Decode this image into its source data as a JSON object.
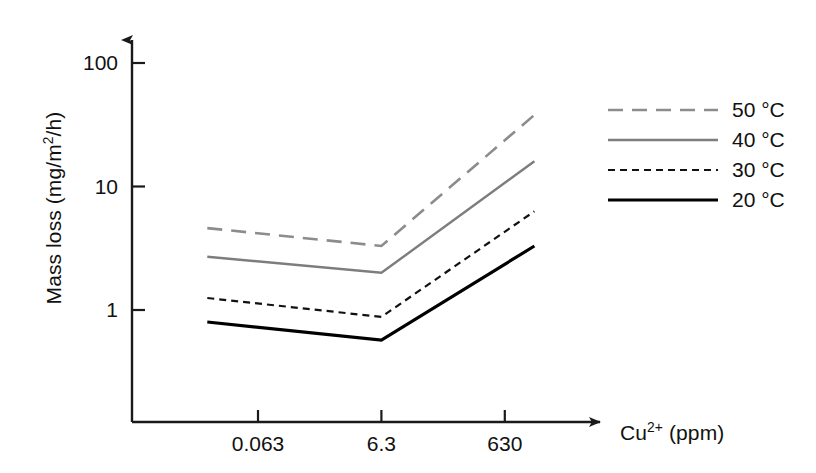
{
  "chart_data": {
    "type": "line",
    "title": "",
    "subtitle": "",
    "xlabel": "Cu2+ (ppm)",
    "xlabel_base": "Cu",
    "xlabel_sup": "2+",
    "xlabel_unit": " (ppm)",
    "ylabel": "Mass loss (mg/m2/h)",
    "ylabel_pre": "Mass loss (mg/m",
    "ylabel_sup": "2",
    "ylabel_post": "/h)",
    "yscale": "log",
    "xscale": "log",
    "grid": false,
    "ylim": [
      0.28,
      180
    ],
    "ytick_labels": [
      "100",
      "10",
      "1"
    ],
    "ytick_values": [
      100,
      10,
      1
    ],
    "categories": [
      "0.063",
      "6.3",
      "630"
    ],
    "x": [
      0.063,
      6.3,
      630
    ],
    "xtick_labels": [
      "0.063",
      "6.3",
      "630"
    ],
    "legend_position": "right",
    "series": [
      {
        "name": "50 °C",
        "label": "50 °C",
        "color": "#8c8c8c",
        "dash": "long-dash",
        "stroke_width": 2.6,
        "values": [
          4.8,
          3.3,
          38
        ],
        "x_extra_left": 0.0095,
        "x_extra_right": 1900,
        "values_extra": [
          4.6,
          3.3,
          38
        ]
      },
      {
        "name": "40 °C",
        "label": "40 °C",
        "color": "#7d7d7d",
        "dash": "solid",
        "stroke_width": 2.4,
        "values": [
          2.8,
          2.0,
          16
        ],
        "x_extra_left": 0.0095,
        "x_extra_right": 1900,
        "values_extra": [
          2.7,
          2.0,
          16
        ]
      },
      {
        "name": "30 °C",
        "label": "30 °C",
        "color": "#111111",
        "dash": "short-dash",
        "stroke_width": 2.2,
        "values": [
          1.25,
          0.88,
          6.3
        ],
        "x_extra_left": 0.0095,
        "x_extra_right": 1900,
        "values_extra": [
          1.25,
          0.88,
          6.3
        ]
      },
      {
        "name": "20 °C",
        "label": "20 °C",
        "color": "#000000",
        "dash": "solid",
        "stroke_width": 3.2,
        "values": [
          0.8,
          0.57,
          3.3
        ],
        "x_extra_left": 0.0095,
        "x_extra_right": 1900,
        "values_extra": [
          0.8,
          0.57,
          3.3
        ]
      }
    ],
    "annotations": []
  },
  "axes": {
    "y_arrow": true,
    "x_arrow": true
  },
  "legend": {
    "entries": [
      {
        "label": "50 °C"
      },
      {
        "label": "40 °C"
      },
      {
        "label": "30 °C"
      },
      {
        "label": "20 °C"
      }
    ]
  }
}
